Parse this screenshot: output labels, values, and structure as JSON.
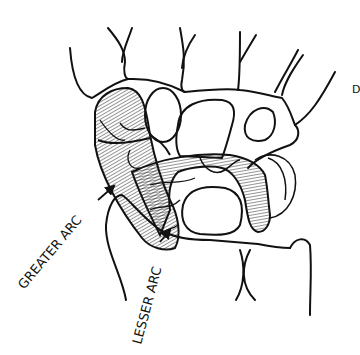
{
  "figure": {
    "panel_letter": "D",
    "labels": {
      "greater_arc": "GREATER ARC",
      "lesser_arc": "LESSER ARC"
    },
    "colors": {
      "background": "#ffffff",
      "ink": "#111111"
    }
  }
}
